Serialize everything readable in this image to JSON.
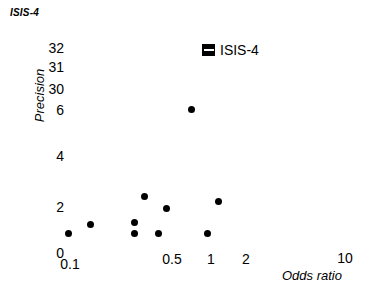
{
  "chart_data": {
    "type": "scatter",
    "title": "ISIS-4",
    "xlabel": "Odds ratio",
    "ylabel": "Precision",
    "xscale": "log",
    "xticks": [
      "0.1",
      "0.5",
      "1",
      "2",
      "10"
    ],
    "xtick_values": [
      0.1,
      0.5,
      1,
      2,
      10
    ],
    "yticks": [
      "0",
      "2",
      "4",
      "6",
      "30",
      "31",
      "32"
    ],
    "ytick_values": [
      0,
      2,
      4,
      6,
      30,
      31,
      32
    ],
    "y_axis_broken": true,
    "grid": false,
    "legend_position": "top-right",
    "series": [
      {
        "name": "ISIS-4",
        "marker": "filled-circle",
        "color": "#000000",
        "points": [
          {
            "x": 0.1,
            "y": 0.9
          },
          {
            "x": 0.15,
            "y": 1.3
          },
          {
            "x": 0.29,
            "y": 1.3
          },
          {
            "x": 0.29,
            "y": 0.85
          },
          {
            "x": 0.33,
            "y": 2.5
          },
          {
            "x": 0.43,
            "y": 1.95
          },
          {
            "x": 0.46,
            "y": 0.85
          },
          {
            "x": 0.73,
            "y": 6.0
          },
          {
            "x": 0.94,
            "y": 0.85
          },
          {
            "x": 1.15,
            "y": 2.2
          }
        ]
      }
    ],
    "legend": [
      {
        "label": "ISIS-4",
        "marker": "square-with-bar",
        "color": "#000000"
      }
    ]
  },
  "layout": {
    "ytick_positions": [
      {
        "label": "32",
        "top": 41
      },
      {
        "label": "31",
        "top": 60
      },
      {
        "label": "30",
        "top": 82
      },
      {
        "label": "6",
        "top": 103
      },
      {
        "label": "4",
        "top": 149
      },
      {
        "label": "2",
        "top": 200
      },
      {
        "label": "0",
        "top": 246
      }
    ],
    "xtick_positions": [
      {
        "label": "0.1",
        "left": 50,
        "top": 257
      },
      {
        "label": "0.5",
        "left": 152,
        "top": 252
      },
      {
        "label": "1",
        "left": 191,
        "top": 252
      },
      {
        "label": "2",
        "left": 226,
        "top": 252
      },
      {
        "label": "10",
        "left": 325,
        "top": 251
      }
    ],
    "point_pixels": [
      {
        "x": 68,
        "y": 233
      },
      {
        "x": 90,
        "y": 224
      },
      {
        "x": 134,
        "y": 222
      },
      {
        "x": 134,
        "y": 233
      },
      {
        "x": 144,
        "y": 196
      },
      {
        "x": 166,
        "y": 208
      },
      {
        "x": 158,
        "y": 233
      },
      {
        "x": 191,
        "y": 109
      },
      {
        "x": 207,
        "y": 233
      },
      {
        "x": 218,
        "y": 201
      }
    ]
  }
}
